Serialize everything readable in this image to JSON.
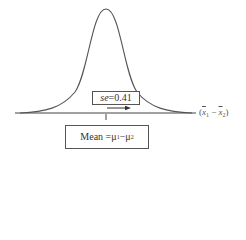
{
  "diagram": {
    "type": "normal-distribution",
    "se_label": {
      "symbol": "se",
      "equals": " = ",
      "value": "0.41"
    },
    "mean_label": {
      "text": "Mean = ",
      "mu1": "μ",
      "sub1": "1",
      "minus": " − ",
      "mu2": "μ",
      "sub2": "2"
    },
    "axis_label": {
      "open": "(",
      "x1": "x",
      "sub1": "1",
      "minus": " − ",
      "x2": "x",
      "sub2": "2",
      "close": ")"
    },
    "colors": {
      "line": "#555555",
      "axis": "#444444",
      "text": "#333333"
    }
  }
}
